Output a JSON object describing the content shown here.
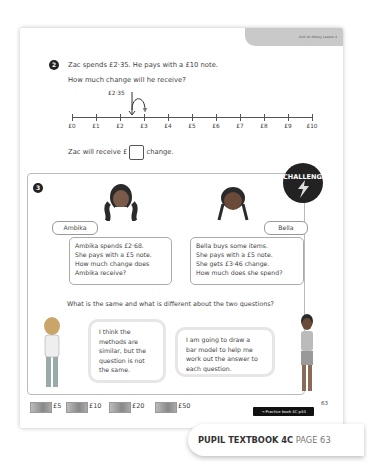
{
  "header": {
    "unit_tab": "Unit 10 Money Lesson 4"
  },
  "question2": {
    "number": "2",
    "line1": "Zac spends £2·35. He pays with a £10 note.",
    "line2": "How much change will he receive?",
    "marker_label": "£2·35",
    "ticks": [
      "£0",
      "£1",
      "£2",
      "£3",
      "£4",
      "£5",
      "£6",
      "£7",
      "£8",
      "£9",
      "£10"
    ],
    "answer_prefix": "Zac will receive £",
    "answer_suffix": "change."
  },
  "question3": {
    "number": "3",
    "badge": "CHALLENGE",
    "ambika": {
      "name": "Ambika",
      "text": [
        "Ambika spends £2·68.",
        "She pays with a £5 note.",
        "How much change does",
        "Ambika receive?"
      ]
    },
    "bella": {
      "name": "Bella",
      "text": [
        "Bella buys some items.",
        "She pays with a £5 note.",
        "She gets £3·46 change.",
        "How much does she spend?"
      ]
    },
    "prompt": "What is the same and what is different about the two questions?",
    "bubble_left": [
      "I think the",
      "methods are",
      "similar, but the",
      "question is not",
      "the same."
    ],
    "bubble_right": [
      "I am going to draw a",
      "bar model to help me",
      "work out the answer to",
      "each question."
    ]
  },
  "notes": [
    {
      "label": "£5",
      "x": 30
    },
    {
      "label": "£10",
      "x": 63
    },
    {
      "label": "£20",
      "x": 103
    },
    {
      "label": "£50",
      "x": 152
    }
  ],
  "practice_link": "→ Practice book 4C p44",
  "page_number": "63",
  "footer": {
    "book": "PUPIL TEXTBOOK 4C",
    "page": "PAGE 63"
  }
}
